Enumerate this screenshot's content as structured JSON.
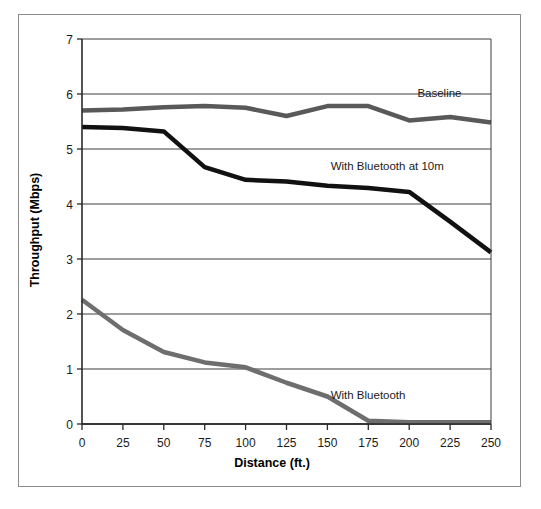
{
  "figure": {
    "background_color": "#ffffff",
    "frame_border_color": "#8b8b8b"
  },
  "chart_data": {
    "type": "line",
    "title": "",
    "xlabel": "Distance (ft.)",
    "ylabel": "Throughput (Mbps)",
    "xlim": [
      0,
      250
    ],
    "ylim": [
      0,
      7
    ],
    "xticks": [
      0,
      25,
      50,
      75,
      100,
      125,
      150,
      175,
      200,
      225,
      250
    ],
    "xtick_labels": [
      "0",
      "25",
      "50",
      "75",
      "100",
      "125",
      "150",
      "175",
      "200",
      "225",
      "250"
    ],
    "yticks": [
      0,
      1,
      2,
      3,
      4,
      5,
      6,
      7
    ],
    "ytick_labels": [
      "0",
      "1",
      "2",
      "3",
      "4",
      "5",
      "6",
      "7"
    ],
    "grid": true,
    "grid_axis": "y",
    "legend": "inline-annotations",
    "x": [
      0,
      25,
      50,
      75,
      100,
      125,
      150,
      175,
      200,
      225,
      250
    ],
    "series": [
      {
        "name": "Baseline",
        "color": "#595959",
        "line_width": 4.5,
        "label_x": 205,
        "label_y": 5.95,
        "values": [
          5.7,
          5.72,
          5.76,
          5.78,
          5.75,
          5.6,
          5.78,
          5.78,
          5.52,
          5.58,
          5.48
        ]
      },
      {
        "name": "With Bluetooth at 10m",
        "color": "#111111",
        "line_width": 4.5,
        "label_x": 152,
        "label_y": 4.62,
        "values": [
          5.4,
          5.38,
          5.32,
          4.67,
          4.44,
          4.41,
          4.33,
          4.29,
          4.22,
          3.68,
          3.12
        ]
      },
      {
        "name": "With Bluetooth",
        "color": "#6e6e6e",
        "line_width": 4.5,
        "label_x": 152,
        "label_y": 0.45,
        "values": [
          2.26,
          1.71,
          1.31,
          1.12,
          1.03,
          0.75,
          0.5,
          0.06,
          0.03,
          0.03,
          0.03
        ]
      }
    ]
  },
  "axes": {
    "x_title": "Distance (ft.)",
    "y_title": "Throughput (Mbps)"
  },
  "annotations": [
    {
      "text": "Baseline",
      "name": "baseline"
    },
    {
      "text": "With Bluetooth at 10m",
      "name": "with-bluetooth-10m"
    },
    {
      "text": "With Bluetooth",
      "name": "with-bluetooth"
    }
  ]
}
